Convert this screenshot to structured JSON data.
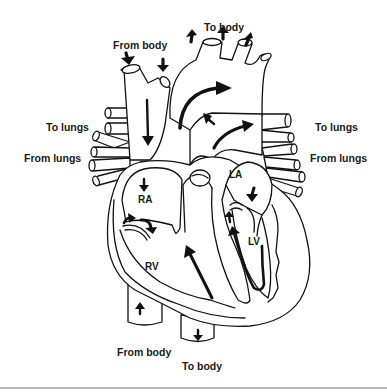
{
  "diagram": {
    "labels": {
      "top_from_body": "From body",
      "top_to_body": "To body",
      "left_to_lungs": "To lungs",
      "left_from_lungs": "From lungs",
      "right_to_lungs": "To lungs",
      "right_from_lungs": "From lungs",
      "bottom_from_body": "From body",
      "bottom_to_body": "To body"
    },
    "chambers": {
      "ra": "RA",
      "rv": "RV",
      "la": "LA",
      "lv": "LV"
    },
    "colors": {
      "line": "#111111",
      "background": "#ffffff",
      "rule": "#b9b9b9"
    }
  }
}
